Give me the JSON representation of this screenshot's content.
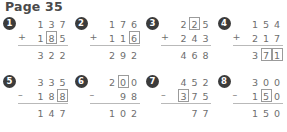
{
  "header": {
    "title": "Page 35"
  },
  "colors": {
    "ink": "#6e6e6e",
    "badge_bg": "#3b3b3b",
    "badge_text": "#ffffff",
    "box_border": "#9b9b9b",
    "rule": "#b9b9b9",
    "title": "#4a4a4a",
    "background": "#ffffff"
  },
  "problems": [
    {
      "number": "1",
      "operator": "+",
      "top": [
        "1",
        "3",
        "7"
      ],
      "top_boxed": [
        false,
        false,
        false
      ],
      "bottom": [
        "1",
        "8",
        "5"
      ],
      "bottom_boxed": [
        false,
        true,
        false
      ],
      "answer": [
        "3",
        "2",
        "2"
      ],
      "answer_boxed": [
        false,
        false,
        false
      ]
    },
    {
      "number": "2",
      "operator": "+",
      "top": [
        "1",
        "7",
        "6"
      ],
      "top_boxed": [
        false,
        false,
        false
      ],
      "bottom": [
        "1",
        "1",
        "6"
      ],
      "bottom_boxed": [
        false,
        false,
        true
      ],
      "answer": [
        "2",
        "9",
        "2"
      ],
      "answer_boxed": [
        false,
        false,
        false
      ]
    },
    {
      "number": "3",
      "operator": "+",
      "top": [
        "2",
        "2",
        "5"
      ],
      "top_boxed": [
        false,
        true,
        false
      ],
      "bottom": [
        "2",
        "4",
        "3"
      ],
      "bottom_boxed": [
        false,
        false,
        false
      ],
      "answer": [
        "4",
        "6",
        "8"
      ],
      "answer_boxed": [
        false,
        false,
        false
      ]
    },
    {
      "number": "4",
      "operator": "+",
      "top": [
        "1",
        "5",
        "4"
      ],
      "top_boxed": [
        false,
        false,
        false
      ],
      "bottom": [
        "2",
        "1",
        "7"
      ],
      "bottom_boxed": [
        false,
        false,
        false
      ],
      "answer": [
        "3",
        "7",
        "1"
      ],
      "answer_boxed": [
        false,
        true,
        true
      ]
    },
    {
      "number": "5",
      "operator": "–",
      "top": [
        "3",
        "3",
        "5"
      ],
      "top_boxed": [
        false,
        false,
        false
      ],
      "bottom": [
        "1",
        "8",
        "8"
      ],
      "bottom_boxed": [
        false,
        false,
        true
      ],
      "answer": [
        "1",
        "4",
        "7"
      ],
      "answer_boxed": [
        false,
        false,
        false
      ]
    },
    {
      "number": "6",
      "operator": "–",
      "top": [
        "2",
        "0",
        "0"
      ],
      "top_boxed": [
        false,
        true,
        false
      ],
      "bottom": [
        "",
        "9",
        "8"
      ],
      "bottom_boxed": [
        false,
        false,
        false
      ],
      "answer": [
        "1",
        "0",
        "2"
      ],
      "answer_boxed": [
        false,
        false,
        false
      ]
    },
    {
      "number": "7",
      "operator": "–",
      "top": [
        "4",
        "5",
        "2"
      ],
      "top_boxed": [
        false,
        false,
        false
      ],
      "bottom": [
        "3",
        "7",
        "5"
      ],
      "bottom_boxed": [
        true,
        false,
        false
      ],
      "answer": [
        "",
        "7",
        "7"
      ],
      "answer_boxed": [
        false,
        false,
        false
      ]
    },
    {
      "number": "8",
      "operator": "–",
      "top": [
        "3",
        "0",
        "0"
      ],
      "top_boxed": [
        false,
        false,
        false
      ],
      "bottom": [
        "1",
        "5",
        "0"
      ],
      "bottom_boxed": [
        false,
        true,
        false
      ],
      "answer": [
        "1",
        "5",
        "0"
      ],
      "answer_boxed": [
        false,
        false,
        false
      ]
    }
  ]
}
